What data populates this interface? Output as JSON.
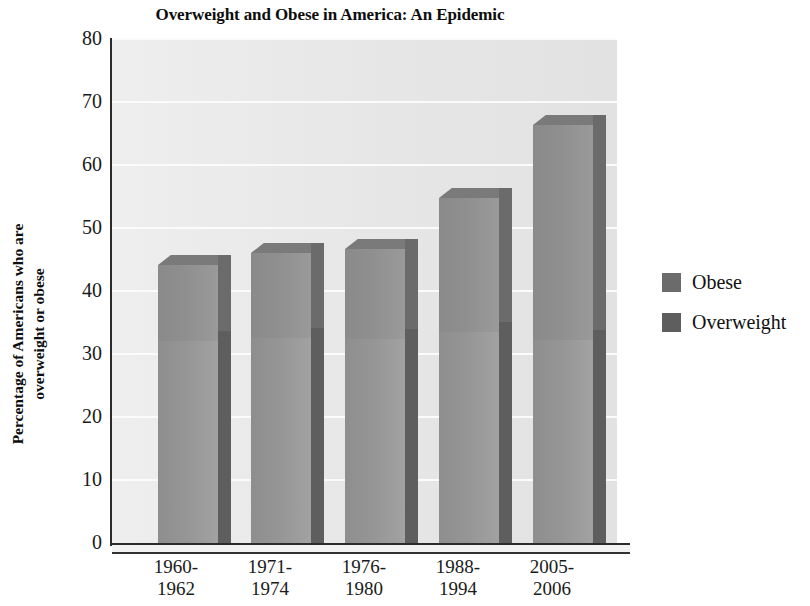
{
  "chart_data": {
    "type": "bar",
    "stacked": true,
    "title": "Overweight and Obese in America: An Epidemic",
    "xlabel": "",
    "ylabel": "Percentage of Americans who are overweight or obese",
    "ylabel_lines": [
      "Percentage of Americans who are",
      "overweight or obese"
    ],
    "categories": [
      "1960-\n1962",
      "1971-\n1974",
      "1976-\n1980",
      "1988-\n1994",
      "2005-\n2006"
    ],
    "category_lines": [
      [
        "1960-",
        "1962"
      ],
      [
        "1971-",
        "1974"
      ],
      [
        "1976-",
        "1980"
      ],
      [
        "1988-",
        "1994"
      ],
      [
        "2005-",
        "2006"
      ]
    ],
    "series": [
      {
        "name": "Overweight",
        "values": [
          32.0,
          32.5,
          32.3,
          33.5,
          32.2
        ],
        "color": "#5e5e5e"
      },
      {
        "name": "Obese",
        "values": [
          12.0,
          13.5,
          14.2,
          21.2,
          34.0
        ],
        "color": "#6b6b6b"
      }
    ],
    "totals": [
      44.0,
      46.0,
      46.5,
      54.7,
      66.2
    ],
    "ylim": [
      0,
      80
    ],
    "yticks": [
      80,
      70,
      60,
      50,
      40,
      30,
      20,
      10,
      0
    ],
    "grid": true,
    "legend_position": "right",
    "legend_entries": [
      "Obese",
      "Overweight"
    ]
  },
  "colors": {
    "plot_background": "#e8e8e8",
    "gridline": "#fbfbfb",
    "axis": "#2b2b2b",
    "obese_fill": "#8f8f8f",
    "obese_side": "#6b6b6b",
    "overweight_fill": "#969696",
    "overweight_side": "#5e5e5e",
    "text": "#111111"
  }
}
